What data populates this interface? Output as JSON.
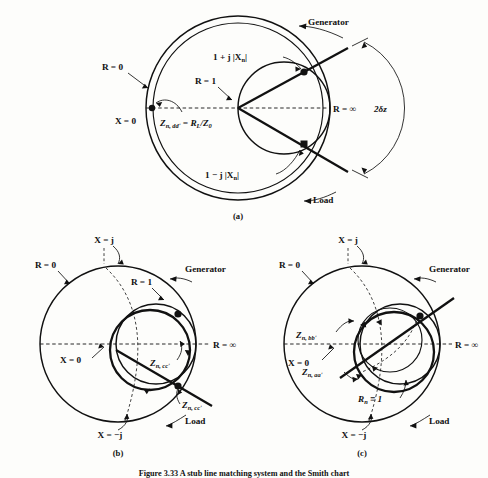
{
  "figure": {
    "caption": "Figure 3.33  A stub line matching system and the Smith chart",
    "background_color": "#fdfdfb",
    "ink_color": "#111111"
  },
  "panels": [
    {
      "tag": "(a)",
      "labels": {
        "r_zero": "R = 0",
        "r_one": "R = 1",
        "r_inf": "R = ∞",
        "x_zero": "X = 0",
        "generator": "Generator",
        "load": "Load",
        "angle": "2δz",
        "upper_point": "1 + j |X",
        "upper_point_sub": "n",
        "upper_point_tail": "|",
        "lower_point": "1 − j |X",
        "lower_point_sub": "n",
        "lower_point_tail": "|",
        "load_impedance_main": "Z",
        "load_impedance_sub": "n, ddʹ",
        "load_impedance_rest": " = R",
        "load_impedance_sub2": "L",
        "load_impedance_rest2": "/Z",
        "load_impedance_sub3": "0"
      }
    },
    {
      "tag": "(b)",
      "labels": {
        "r_zero": "R = 0",
        "r_one": "R = 1",
        "r_inf": "R = ∞",
        "x_zero": "X = 0",
        "x_plus_j": "X = j",
        "x_minus_j": "X = −j",
        "generator": "Generator",
        "load": "Load",
        "z_cc_upper_main": "Z",
        "z_cc_upper_sub": "n, ccʹ",
        "z_cc_lower_main": "Z",
        "z_cc_lower_sub": "n, ccʹ"
      }
    },
    {
      "tag": "(c)",
      "labels": {
        "r_zero": "R = 0",
        "r_inf": "R = ∞",
        "x_zero": "X = 0",
        "x_plus_j": "X = j",
        "x_minus_j": "X = −j",
        "generator": "Generator",
        "load": "Load",
        "rn_one_main": "R",
        "rn_one_sub": "n",
        "rn_one_rest": " ≡ 1",
        "z_bb_main": "Z",
        "z_bb_sub": "n, bbʹ",
        "z_aa_main": "Z",
        "z_aa_sub": "n, aaʹ"
      }
    }
  ]
}
